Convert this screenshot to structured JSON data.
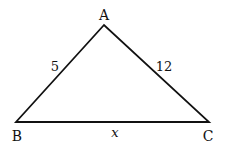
{
  "diagram": {
    "type": "triangle",
    "vertices": [
      {
        "name": "A",
        "x": 104,
        "y": 25
      },
      {
        "name": "B",
        "x": 16,
        "y": 122
      },
      {
        "name": "C",
        "x": 209,
        "y": 122
      }
    ],
    "labels": {
      "A": "A",
      "B": "B",
      "C": "C"
    },
    "sides": {
      "AB": "5",
      "AC": "12",
      "BC": "x"
    },
    "stroke_color": "#111111"
  }
}
